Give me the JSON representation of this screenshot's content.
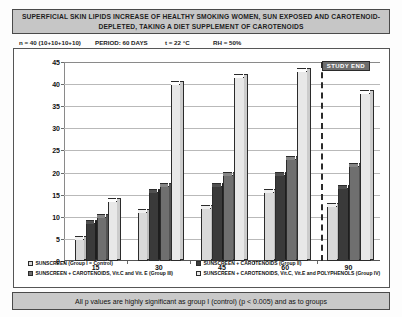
{
  "title": "SUPERFICIAL SKIN LIPIDS INCREASE OF HEALTHY SMOKING WOMEN, SUN EXPOSED AND CAROTENOID-DEPLETED, TAKING A DIET SUPPLEMENT OF CAROTENOIDS",
  "meta": {
    "n": "n = 40 (10+10+10+10)",
    "period": "PERIOD: 60 DAYS",
    "temperature": "t = 22 °C",
    "humidity": "RH = 50%"
  },
  "annotation": {
    "study_end_label": "STUDY END"
  },
  "footer": {
    "note": "All p values are highly significant as group I (control) (p < 0.005) and as to groups"
  },
  "colors": {
    "series1": "#d9d9d9",
    "series2": "#9a9a9a",
    "series3": "#3a3a3a",
    "series4": "#6f6f6f",
    "series4_light": "#e8e8e8",
    "banner": "#c6c6c6",
    "footer": "#c9c9c9",
    "badge": "#6d6d6d",
    "grid": "#b9b9b9",
    "axis": "#555555"
  },
  "chart_data": {
    "type": "bar",
    "title": "SUPERFICIAL SKIN LIPIDS INCREASE OF HEALTHY SMOKING WOMEN, SUN EXPOSED AND CAROTENOID-DEPLETED, TAKING A DIET SUPPLEMENT OF CAROTENOIDS",
    "xlabel": "",
    "ylabel": "% SUPERFICIAL SKIN LIPIDS INCREASE",
    "categories": [
      "15",
      "30",
      "45",
      "60",
      "90"
    ],
    "ylim": [
      0,
      45
    ],
    "yticks": [
      0,
      5,
      10,
      15,
      20,
      25,
      30,
      35,
      40,
      45
    ],
    "grid": true,
    "legend_position": "bottom",
    "series": [
      {
        "name": "SUNSCREEN (Group I = Control)",
        "color": "#d9d9d9",
        "values": [
          5.0,
          11.0,
          12.0,
          15.5,
          12.5
        ]
      },
      {
        "name": "SUNSCREEN + CAROTENOIDS (Group II)",
        "color": "#3a3a3a",
        "values": [
          8.5,
          15.5,
          17.0,
          19.5,
          16.5
        ]
      },
      {
        "name": "SUNSCREEN + CAROTENOIDS, Vit.C and Vit. E (Group III)",
        "color": "#6f6f6f",
        "values": [
          10.0,
          17.0,
          19.5,
          23.0,
          21.5
        ]
      },
      {
        "name": "SUNSCREEN + CAROTENOIDS, Vit.C, Vit.E and POLYPHENOLS (Group IV)",
        "color": "#e8e8e8",
        "values": [
          13.5,
          40.0,
          41.5,
          43.0,
          38.0
        ]
      }
    ]
  }
}
